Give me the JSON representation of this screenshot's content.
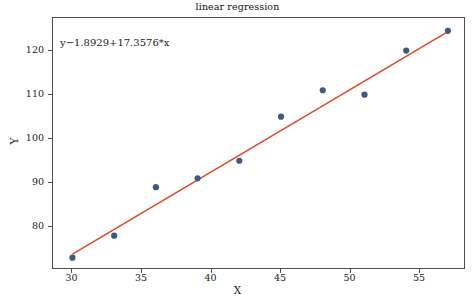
{
  "chart_data": {
    "type": "scatter",
    "title": "linear regression",
    "xlabel": "X",
    "ylabel": "Y",
    "x": [
      30,
      33,
      36,
      39,
      42,
      45,
      48,
      51,
      54,
      57
    ],
    "values": [
      73,
      78,
      89,
      91,
      95,
      105,
      111,
      110,
      120,
      124.5
    ],
    "series": [
      {
        "name": "data points",
        "type": "scatter",
        "x": [
          30,
          33,
          36,
          39,
          42,
          45,
          48,
          51,
          54,
          57
        ],
        "values": [
          73,
          78,
          89,
          91,
          95,
          105,
          111,
          110,
          120,
          124.5
        ],
        "color": "#3d5a80",
        "marker": "circle"
      },
      {
        "name": "regression line",
        "type": "line",
        "x": [
          30,
          57
        ],
        "values": [
          73.8,
          124.3
        ],
        "color": "#e04a28"
      }
    ],
    "annotation": "y−1.8929+17.3576*x",
    "xticks": [
      30,
      35,
      40,
      45,
      50,
      55
    ],
    "yticks": [
      80,
      90,
      100,
      110,
      120
    ],
    "xlim": [
      28.6,
      58.3
    ],
    "ylim": [
      70.2,
      127.4
    ],
    "grid": false,
    "legend": "none"
  },
  "colors": {
    "marker": "#3d5a80",
    "line": "#e04a28",
    "axis": "#4d4d4d",
    "text": "#1a1a1a",
    "background": "#ffffff"
  }
}
